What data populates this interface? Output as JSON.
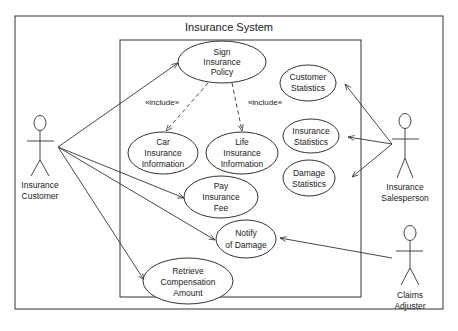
{
  "diagram": {
    "type": "uml-use-case",
    "title": "Insurance System",
    "actors": [
      {
        "id": "customer",
        "label_lines": [
          "Insurance",
          "Customer"
        ]
      },
      {
        "id": "salesperson",
        "label_lines": [
          "Insurance",
          "Salesperson"
        ]
      },
      {
        "id": "adjuster",
        "label_lines": [
          "Claims",
          "Adjuster"
        ]
      }
    ],
    "use_cases": [
      {
        "id": "sign",
        "label_lines": [
          "Sign",
          "Insurance",
          "Policy"
        ]
      },
      {
        "id": "custstats",
        "label_lines": [
          "Customer",
          "Statistics"
        ]
      },
      {
        "id": "car",
        "label_lines": [
          "Car",
          "Insurance",
          "Information"
        ]
      },
      {
        "id": "life",
        "label_lines": [
          "Life",
          "Insurance",
          "Information"
        ]
      },
      {
        "id": "inststats",
        "label_lines": [
          "Insurance",
          "Statistics"
        ]
      },
      {
        "id": "dmgstats",
        "label_lines": [
          "Damage",
          "Statistics"
        ]
      },
      {
        "id": "pay",
        "label_lines": [
          "Pay",
          "Insurance",
          "Fee"
        ]
      },
      {
        "id": "notify",
        "label_lines": [
          "Notify",
          "of Damage"
        ]
      },
      {
        "id": "retrieve",
        "label_lines": [
          "Retrieve",
          "Compensation",
          "Amount"
        ]
      }
    ],
    "relations": [
      {
        "from": "customer",
        "to": "sign",
        "kind": "association"
      },
      {
        "from": "customer",
        "to": "pay",
        "kind": "association"
      },
      {
        "from": "customer",
        "to": "notify",
        "kind": "association"
      },
      {
        "from": "customer",
        "to": "retrieve",
        "kind": "association"
      },
      {
        "from": "salesperson",
        "to": "custstats",
        "kind": "association"
      },
      {
        "from": "salesperson",
        "to": "inststats",
        "kind": "association"
      },
      {
        "from": "salesperson",
        "to": "dmgstats",
        "kind": "association"
      },
      {
        "from": "adjuster",
        "to": "notify",
        "kind": "association"
      },
      {
        "from": "sign",
        "to": "car",
        "kind": "include",
        "label": "«include»"
      },
      {
        "from": "sign",
        "to": "life",
        "kind": "include",
        "label": "«include»"
      }
    ],
    "include_label": "«include»"
  }
}
